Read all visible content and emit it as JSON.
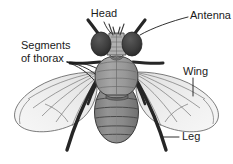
{
  "figure": {
    "background_color": "#ffffff",
    "width": 233,
    "height": 164
  },
  "labels": [
    {
      "id": "head",
      "text": "Head",
      "x": 104,
      "y": 17,
      "anchor": "middle"
    },
    {
      "id": "antenna",
      "text": "Antenna",
      "x": 190,
      "y": 19,
      "anchor": "start"
    },
    {
      "id": "segments",
      "text": "Segments",
      "x": 21,
      "y": 49,
      "anchor": "start"
    },
    {
      "id": "thorax",
      "text": "of thorax",
      "x": 21,
      "y": 62,
      "anchor": "start"
    },
    {
      "id": "wing",
      "text": "Wing",
      "x": 183,
      "y": 75,
      "anchor": "start"
    },
    {
      "id": "leg",
      "text": "Leg",
      "x": 182,
      "y": 140,
      "anchor": "start"
    }
  ],
  "colors": {
    "background": "#ffffff",
    "label_text": "#1a1a1a",
    "leader_line": "#1a1a1a",
    "eye_dark": "#3a3a3a",
    "face_light": "#b8b8b8",
    "thorax_gray": "#9a9a9a",
    "thorax_shade": "#828282",
    "abdomen_gray": "#8a8a8a",
    "abdomen_segment_line": "#4a4a4a",
    "wing_fill": "#ededed",
    "wing_vein": "#6e6e6e",
    "wing_outline": "#555555",
    "leg_dark": "#2b2b2b",
    "body_outline": "#3a3a3a"
  },
  "anatomy_parts": [
    {
      "name": "head",
      "description": "Dark compound eyes flanking a lighter textured face at top of body"
    },
    {
      "name": "antenna",
      "description": "Pair of thin appendages projecting upward and outward from head"
    },
    {
      "name": "thorax",
      "description": "Large segmented middle body region bearing wings and legs"
    },
    {
      "name": "abdomen",
      "description": "Oval posterior body region with six transverse segments"
    },
    {
      "name": "wing-left",
      "description": "Translucent pale wing sweeping left and down with radiating veins"
    },
    {
      "name": "wing-right",
      "description": "Translucent pale wing sweeping right and down with radiating veins"
    },
    {
      "name": "legs",
      "description": "Six dark jointed legs extending from the thorax"
    }
  ]
}
